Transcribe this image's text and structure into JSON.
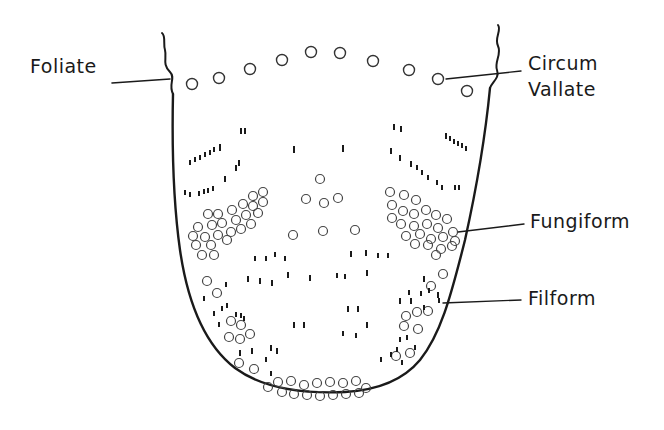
{
  "diagram": {
    "labels": {
      "foliate": "Foliate",
      "circum": "Circum",
      "vallate": "Vallate",
      "fungiform": "Fungiform",
      "filform": "Filform"
    },
    "colors": {
      "ink": "#1a1a1a",
      "background": "#ffffff"
    }
  }
}
